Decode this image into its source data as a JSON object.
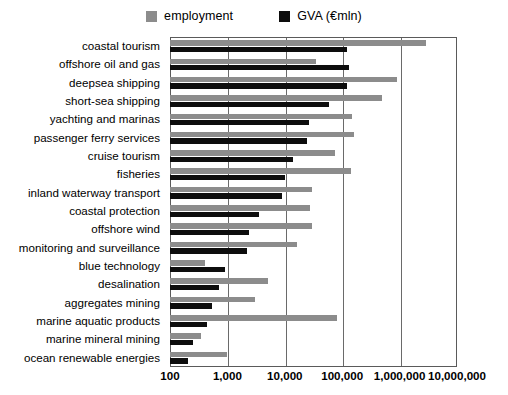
{
  "legend": {
    "position": "top-center",
    "items": [
      {
        "label": "employment",
        "color": "#8c8c8c",
        "icon": "square-swatch"
      },
      {
        "label": "GVA (€mln)",
        "color": "#0d0d0d",
        "icon": "square-swatch"
      }
    ]
  },
  "axis": {
    "x_ticks": [
      "100",
      "1,000",
      "10,000",
      "100,000",
      "1,000,000",
      "10,000,000"
    ],
    "scale": "log10",
    "xmin": 100,
    "xmax": 10000000
  },
  "chart_data": {
    "type": "bar",
    "orientation": "horizontal",
    "title": "",
    "subtitle": "",
    "xlabel": "",
    "ylabel": "",
    "xscale": "log",
    "xlim": [
      100,
      10000000
    ],
    "xticks": [
      100,
      1000,
      10000,
      100000,
      1000000,
      10000000
    ],
    "xticklabels": [
      "100",
      "1,000",
      "10,000",
      "100,000",
      "1,000,000",
      "10,000,000"
    ],
    "grid": true,
    "legend": "top-center",
    "categories": [
      "coastal tourism",
      "offshore oil and gas",
      "deepsea shipping",
      "short-sea shipping",
      "yachting and marinas",
      "passenger ferry services",
      "cruise tourism",
      "fisheries",
      "inland waterway transport",
      "coastal protection",
      "offshore wind",
      "monitoring and surveillance",
      "blue technology",
      "desalination",
      "aggregates mining",
      "marine aquatic products",
      "marine mineral mining",
      "ocean renewable energies"
    ],
    "series": [
      {
        "name": "employment",
        "color": "#8c8c8c",
        "values": [
          2900000,
          35000,
          900000,
          500000,
          150000,
          160000,
          75000,
          140000,
          30000,
          27000,
          30000,
          16000,
          400,
          5200,
          3000,
          80000,
          350,
          1000
        ]
      },
      {
        "name": "GVA (€mln)",
        "color": "#0d0d0d",
        "values": [
          120000,
          130000,
          120000,
          58000,
          26000,
          24000,
          14000,
          10000,
          9000,
          3600,
          2400,
          2200,
          900,
          700,
          550,
          450,
          250,
          210
        ]
      }
    ]
  }
}
